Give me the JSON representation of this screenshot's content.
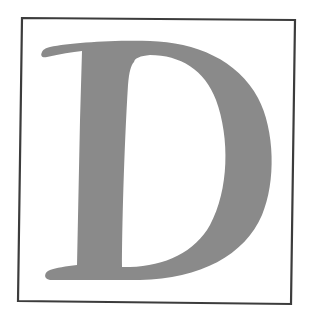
{
  "figure": {
    "letter": "D",
    "colors": {
      "background": "#ffffff",
      "frame": "#3c3c3c",
      "glyph": "#8a8a8a"
    }
  }
}
